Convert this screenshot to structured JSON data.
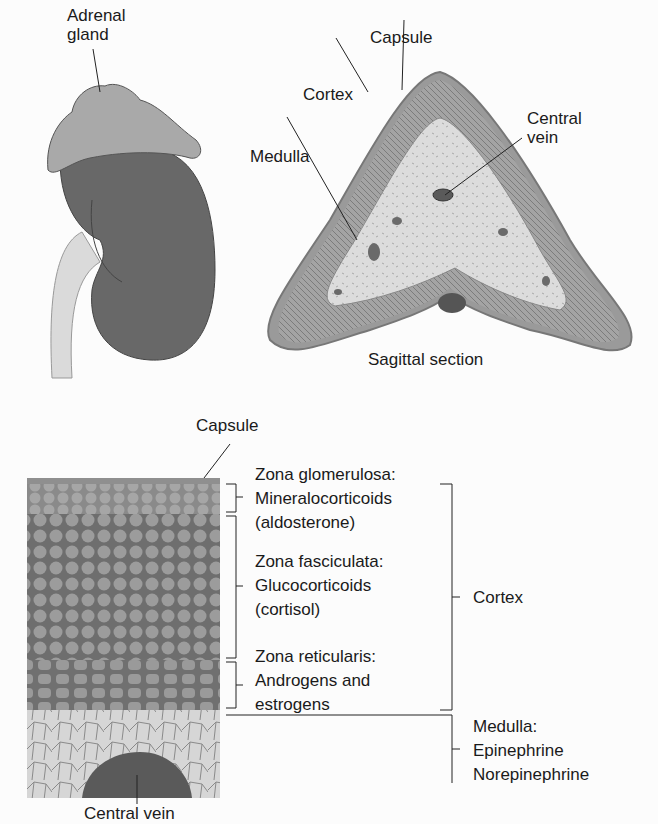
{
  "top_left": {
    "adrenal_gland_label_line1": "Adrenal",
    "adrenal_gland_label_line2": "gland"
  },
  "sagittal": {
    "capsule": "Capsule",
    "cortex": "Cortex",
    "medulla": "Medulla",
    "central_vein_line1": "Central",
    "central_vein_line2": "vein",
    "caption": "Sagittal section"
  },
  "histology": {
    "capsule": "Capsule",
    "central_vein": "Central vein",
    "zones": [
      {
        "name": "Zona glomerulosa:",
        "hormone1": "Mineralocorticoids",
        "hormone2": "(aldosterone)"
      },
      {
        "name": "Zona fasciculata:",
        "hormone1": "Glucocorticoids",
        "hormone2": "(cortisol)"
      },
      {
        "name": "Zona reticularis:",
        "hormone1": "Androgens and",
        "hormone2": "estrogens"
      }
    ],
    "cortex": "Cortex",
    "medulla": {
      "name": "Medulla:",
      "hormone1": "Epinephrine",
      "hormone2": "Norepinephrine"
    }
  },
  "colors": {
    "kidney": "#6a6a6a",
    "adrenal": "#a9a9a9",
    "ureter": "#d8d8d8",
    "cortex": "#8e8e8e",
    "medulla": "#d2d2d2",
    "vein": "#5a5a5a"
  }
}
